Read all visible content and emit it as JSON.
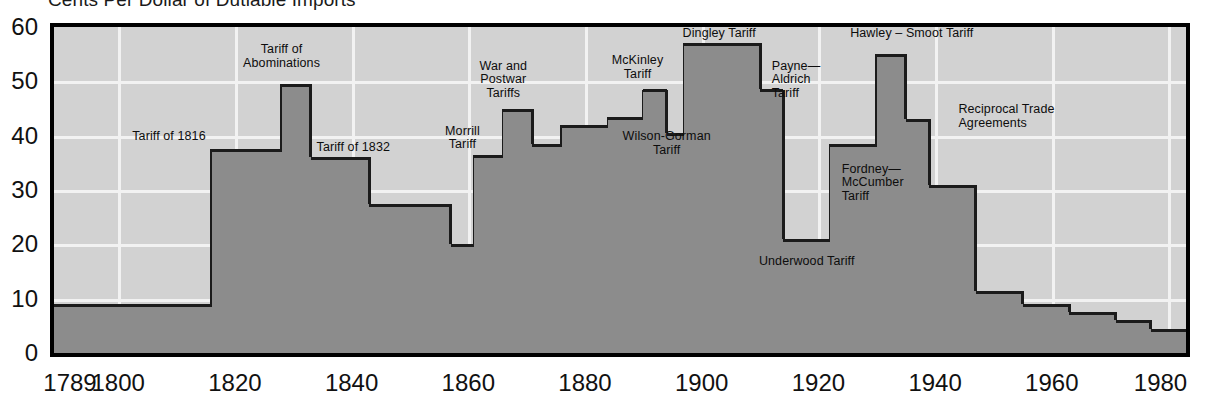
{
  "chart_data": {
    "type": "area",
    "title": "Cents Per Dollar of Dutiable Imports",
    "xlabel": "",
    "ylabel": "",
    "xlim": [
      1789,
      1983
    ],
    "ylim": [
      0,
      60
    ],
    "grid": true,
    "legend": "none",
    "x_ticks": [
      "1789",
      "1800",
      "1820",
      "1840",
      "1860",
      "1880",
      "1900",
      "1920",
      "1940",
      "1960",
      "1980"
    ],
    "x_tick_values": [
      1789,
      1800,
      1820,
      1840,
      1860,
      1880,
      1900,
      1920,
      1940,
      1960,
      1980
    ],
    "y_ticks": [
      "0",
      "10",
      "20",
      "30",
      "40",
      "50",
      "60"
    ],
    "y_tick_values": [
      0,
      10,
      20,
      30,
      40,
      50,
      60
    ],
    "series_name": "Average tariff rate on dutiable imports",
    "steps": [
      {
        "year": 1789,
        "value": 9
      },
      {
        "year": 1816,
        "value": 37.5
      },
      {
        "year": 1828,
        "value": 49.5
      },
      {
        "year": 1833,
        "value": 36
      },
      {
        "year": 1843,
        "value": 27.5
      },
      {
        "year": 1857,
        "value": 20
      },
      {
        "year": 1861,
        "value": 36.5
      },
      {
        "year": 1866,
        "value": 45
      },
      {
        "year": 1871,
        "value": 38.5
      },
      {
        "year": 1876,
        "value": 42
      },
      {
        "year": 1884,
        "value": 43.5
      },
      {
        "year": 1890,
        "value": 48.5
      },
      {
        "year": 1894,
        "value": 40.5
      },
      {
        "year": 1897,
        "value": 57
      },
      {
        "year": 1910,
        "value": 48.5
      },
      {
        "year": 1914,
        "value": 21
      },
      {
        "year": 1922,
        "value": 38.5
      },
      {
        "year": 1930,
        "value": 55
      },
      {
        "year": 1935,
        "value": 43
      },
      {
        "year": 1939,
        "value": 31
      },
      {
        "year": 1947,
        "value": 11.5
      },
      {
        "year": 1955,
        "value": 9
      },
      {
        "year": 1963,
        "value": 7.5
      },
      {
        "year": 1971,
        "value": 6
      },
      {
        "year": 1977,
        "value": 4.5
      }
    ],
    "annotations": [
      {
        "id": "tariff-of-1816",
        "text": "Tariff of 1816",
        "year": 1815,
        "value": 41,
        "align": "r"
      },
      {
        "id": "tariff-of-abominations",
        "text": "Tariff of\nAbominations",
        "year": 1828,
        "value": 57,
        "align": "c"
      },
      {
        "id": "tariff-of-1832",
        "text": "Tariff of 1832",
        "year": 1834,
        "value": 39,
        "align": "l"
      },
      {
        "id": "morrill-tariff",
        "text": "Morrill\nTariff",
        "year": 1859,
        "value": 42,
        "align": "c"
      },
      {
        "id": "war-and-postwar-tariffs",
        "text": "War and\nPostwar\nTariffs",
        "year": 1866,
        "value": 54,
        "align": "c"
      },
      {
        "id": "mckinley-tariff",
        "text": "McKinley\nTariff",
        "year": 1889,
        "value": 55,
        "align": "c"
      },
      {
        "id": "wilson-gorman-tariff",
        "text": "Wilson-Gorman\nTariff",
        "year": 1894,
        "value": 41,
        "align": "c"
      },
      {
        "id": "dingley-tariff",
        "text": "Dingley Tariff",
        "year": 1903,
        "value": 60,
        "align": "c"
      },
      {
        "id": "payne-aldrich-tariff",
        "text": "Payne—\nAldrich\nTariff",
        "year": 1912,
        "value": 54,
        "align": "l"
      },
      {
        "id": "underwood-tariff",
        "text": "Underwood Tariff",
        "year": 1918,
        "value": 18,
        "align": "c"
      },
      {
        "id": "fordney-mccumber-tariff",
        "text": "Fordney—\nMcCumber\nTariff",
        "year": 1924,
        "value": 35,
        "align": "l"
      },
      {
        "id": "hawley-smoot-tariff",
        "text": "Hawley – Smoot Tariff",
        "year": 1936,
        "value": 60,
        "align": "c"
      },
      {
        "id": "reciprocal-trade-agreements",
        "text": "Reciprocal Trade\nAgreements",
        "year": 1944,
        "value": 46,
        "align": "l"
      }
    ]
  }
}
